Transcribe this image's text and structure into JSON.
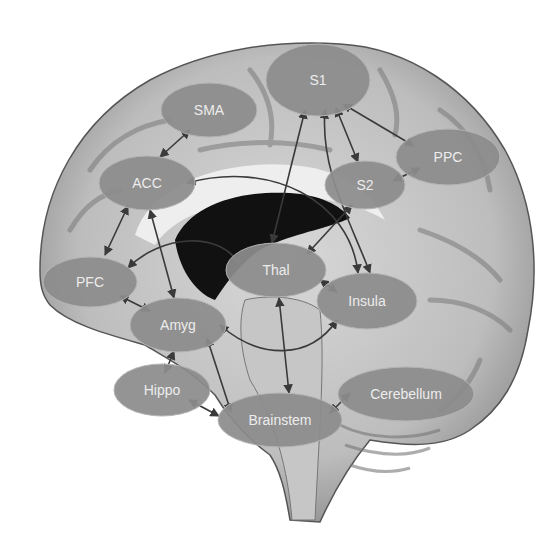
{
  "diagram": {
    "node_color": "#8c8c8c",
    "node_stroke": "#b4b4b4",
    "label_color": "#ececec",
    "arrow_color": "#3a3a3a",
    "nodes": [
      {
        "id": "S1",
        "label": "S1",
        "cx": 318,
        "cy": 80,
        "rx": 52,
        "ry": 36
      },
      {
        "id": "SMA",
        "label": "SMA",
        "cx": 209,
        "cy": 110,
        "rx": 48,
        "ry": 27
      },
      {
        "id": "PPC",
        "label": "PPC",
        "cx": 448,
        "cy": 157,
        "rx": 52,
        "ry": 28
      },
      {
        "id": "ACC",
        "label": "ACC",
        "cx": 147,
        "cy": 183,
        "rx": 48,
        "ry": 27
      },
      {
        "id": "S2",
        "label": "S2",
        "cx": 365,
        "cy": 185,
        "rx": 40,
        "ry": 24
      },
      {
        "id": "Thal",
        "label": "Thal",
        "cx": 276,
        "cy": 270,
        "rx": 50,
        "ry": 27
      },
      {
        "id": "PFC",
        "label": "PFC",
        "cx": 90,
        "cy": 282,
        "rx": 47,
        "ry": 25
      },
      {
        "id": "Insula",
        "label": "Insula",
        "cx": 367,
        "cy": 301,
        "rx": 50,
        "ry": 28
      },
      {
        "id": "Amyg",
        "label": "Amyg",
        "cx": 178,
        "cy": 325,
        "rx": 48,
        "ry": 27
      },
      {
        "id": "Hippo",
        "label": "Hippo",
        "cx": 162,
        "cy": 390,
        "rx": 48,
        "ry": 26
      },
      {
        "id": "Cerebellum",
        "label": "Cerebellum",
        "cx": 406,
        "cy": 394,
        "rx": 68,
        "ry": 27
      },
      {
        "id": "Brainstem",
        "label": "Brainstem",
        "cx": 280,
        "cy": 420,
        "rx": 62,
        "ry": 27
      }
    ],
    "connections": [
      {
        "from": "SMA",
        "to": "ACC",
        "type": "bidirectional"
      },
      {
        "from": "ACC",
        "to": "PFC",
        "type": "bidirectional"
      },
      {
        "from": "ACC",
        "to": "Amyg",
        "type": "bidirectional"
      },
      {
        "from": "ACC",
        "to": "Insula",
        "type": "bidirectional",
        "curved": true
      },
      {
        "from": "PFC",
        "to": "Thal",
        "type": "bidirectional",
        "curved": true
      },
      {
        "from": "PFC",
        "to": "Amyg",
        "type": "bidirectional"
      },
      {
        "from": "S1",
        "to": "Thal",
        "type": "bidirectional"
      },
      {
        "from": "S1",
        "to": "S2",
        "type": "bidirectional"
      },
      {
        "from": "S1",
        "to": "PPC",
        "type": "bidirectional"
      },
      {
        "from": "S1",
        "to": "Insula",
        "type": "bidirectional",
        "curved": true
      },
      {
        "from": "S2",
        "to": "PPC",
        "type": "bidirectional"
      },
      {
        "from": "S2",
        "to": "Thal",
        "type": "bidirectional"
      },
      {
        "from": "Thal",
        "to": "Insula",
        "type": "bidirectional"
      },
      {
        "from": "Thal",
        "to": "Brainstem",
        "type": "bidirectional"
      },
      {
        "from": "Amyg",
        "to": "Insula",
        "type": "bidirectional",
        "curved": true
      },
      {
        "from": "Amyg",
        "to": "Hippo",
        "type": "bidirectional"
      },
      {
        "from": "Amyg",
        "to": "Brainstem",
        "type": "bidirectional"
      },
      {
        "from": "Hippo",
        "to": "Brainstem",
        "type": "bidirectional"
      },
      {
        "from": "Brainstem",
        "to": "Cerebellum",
        "type": "bidirectional"
      }
    ]
  }
}
